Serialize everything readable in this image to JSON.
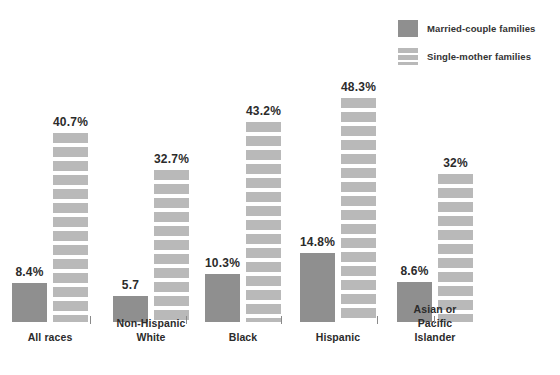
{
  "legend": {
    "items": [
      {
        "label": "Married-couple families",
        "swatch": "solid",
        "color": "#8f8f8f",
        "icon": "legend-swatch-solid-icon"
      },
      {
        "label": "Single-mother families",
        "swatch": "striped",
        "color": "#b9b9b9",
        "icon": "legend-swatch-striped-icon"
      }
    ]
  },
  "chart_data": {
    "type": "bar",
    "title": "",
    "subtitle": "",
    "xlabel": "",
    "ylabel": "",
    "grid": false,
    "legend_position": "top-right",
    "ylim": [
      0,
      48.3
    ],
    "categories": [
      "All races",
      "Non-Hispanic White",
      "Black",
      "Hispanic",
      "Asian or Pacific Islander"
    ],
    "category_lines": [
      [
        "All races"
      ],
      [
        "Non-Hispanic",
        "White"
      ],
      [
        "Black"
      ],
      [
        "Hispanic"
      ],
      [
        "Asian or",
        "Pacific Islander"
      ]
    ],
    "series": [
      {
        "name": "Married-couple families",
        "style": "solid",
        "color": "#8f8f8f",
        "values": [
          8.4,
          5.7,
          10.3,
          14.8,
          8.6
        ],
        "labels": [
          "8.4%",
          "5.7",
          "10.3%",
          "14.8%",
          "8.6%"
        ]
      },
      {
        "name": "Single-mother families",
        "style": "striped",
        "color": "#b9b9b9",
        "values": [
          40.7,
          32.7,
          43.2,
          48.3,
          32.0
        ],
        "labels": [
          "40.7%",
          "32.7%",
          "43.2%",
          "48.3%",
          "32%"
        ]
      }
    ]
  }
}
